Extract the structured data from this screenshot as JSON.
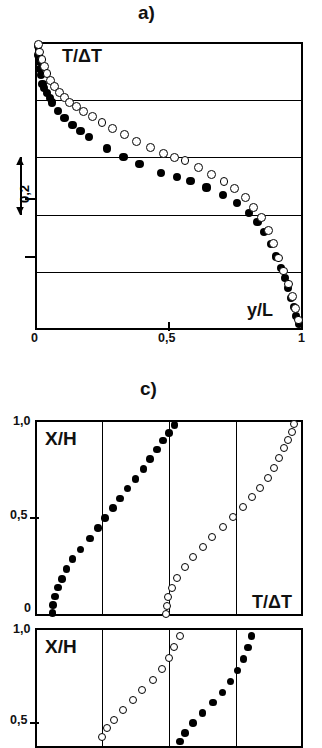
{
  "figure": {
    "panels": [
      {
        "caption": "a)",
        "y_axis_label": "T/ΔT",
        "x_axis_label": "y/L",
        "x_tick_labels": [
          "0",
          "0,5",
          "1"
        ],
        "scale_bar_label": "0,2"
      },
      {
        "caption": "c)",
        "y_axis_label": "X/H",
        "x_axis_label": "T/ΔT",
        "y_tick_labels": [
          "1,0",
          "0,5",
          "0"
        ]
      },
      {
        "caption": "",
        "y_axis_label": "X/H",
        "y_tick_labels": [
          "1,0",
          "0,5"
        ]
      }
    ],
    "series_names": [
      "filled-circles",
      "open-circles"
    ],
    "colors": {
      "ink": "#000000",
      "background": "#ffffff"
    }
  },
  "chart_data": [
    {
      "type": "scatter",
      "title": "a)",
      "xlabel": "y/L",
      "ylabel": "T/ΔT",
      "xlim": [
        0,
        1
      ],
      "ylim": [
        0,
        1
      ],
      "xticks": [
        0,
        0.5,
        1
      ],
      "xticklabels": [
        "0",
        "0,5",
        "1"
      ],
      "grid": "horizontal",
      "gridlines_y": [
        0.2,
        0.4,
        0.6,
        0.8
      ],
      "scale_bar": "0,2",
      "series": [
        {
          "name": "filled-circles",
          "marker": "filled",
          "x": [
            0.01,
            0.013,
            0.018,
            0.02,
            0.022,
            0.028,
            0.035,
            0.045,
            0.055,
            0.062,
            0.085,
            0.11,
            0.14,
            0.17,
            0.2,
            0.27,
            0.33,
            0.39,
            0.47,
            0.53,
            0.58,
            0.64,
            0.7,
            0.755,
            0.8,
            0.83,
            0.855,
            0.88,
            0.9,
            0.918,
            0.932,
            0.945,
            0.955,
            0.965,
            0.975,
            0.985
          ],
          "y": [
            0.985,
            0.955,
            0.93,
            0.905,
            0.885,
            0.855,
            0.84,
            0.822,
            0.805,
            0.79,
            0.76,
            0.735,
            0.712,
            0.69,
            0.67,
            0.63,
            0.6,
            0.575,
            0.545,
            0.53,
            0.518,
            0.495,
            0.47,
            0.44,
            0.405,
            0.375,
            0.34,
            0.3,
            0.255,
            0.215,
            0.18,
            0.145,
            0.11,
            0.08,
            0.05,
            0.02
          ]
        },
        {
          "name": "open-circles",
          "marker": "open",
          "x": [
            0.012,
            0.018,
            0.026,
            0.034,
            0.045,
            0.058,
            0.072,
            0.09,
            0.11,
            0.13,
            0.155,
            0.18,
            0.215,
            0.25,
            0.29,
            0.335,
            0.38,
            0.43,
            0.48,
            0.52,
            0.56,
            0.61,
            0.66,
            0.705,
            0.745,
            0.785,
            0.815,
            0.845,
            0.87,
            0.89,
            0.91,
            0.928,
            0.945,
            0.96,
            0.972,
            0.982
          ],
          "y": [
            0.99,
            0.965,
            0.94,
            0.915,
            0.89,
            0.865,
            0.845,
            0.825,
            0.808,
            0.79,
            0.775,
            0.76,
            0.74,
            0.72,
            0.7,
            0.678,
            0.655,
            0.635,
            0.612,
            0.6,
            0.588,
            0.565,
            0.54,
            0.515,
            0.49,
            0.46,
            0.425,
            0.39,
            0.345,
            0.3,
            0.25,
            0.205,
            0.16,
            0.115,
            0.075,
            0.035
          ]
        }
      ]
    },
    {
      "type": "scatter",
      "title": "c)",
      "xlabel": "T/ΔT",
      "ylabel": "X/H",
      "ylim": [
        0,
        1
      ],
      "yticks": [
        0,
        0.5,
        1
      ],
      "yticklabels": [
        "0",
        "0,5",
        "1,0"
      ],
      "grid": "vertical",
      "gridlines_x": [
        0.25,
        0.5,
        0.75
      ],
      "series": [
        {
          "name": "filled-circles",
          "marker": "filled",
          "x": [
            0.065,
            0.068,
            0.075,
            0.085,
            0.1,
            0.118,
            0.14,
            0.17,
            0.205,
            0.235,
            0.262,
            0.29,
            0.318,
            0.345,
            0.375,
            0.405,
            0.43,
            0.455,
            0.478,
            0.5,
            0.52
          ],
          "y": [
            0.015,
            0.055,
            0.1,
            0.145,
            0.19,
            0.24,
            0.29,
            0.34,
            0.395,
            0.45,
            0.5,
            0.55,
            0.6,
            0.65,
            0.7,
            0.75,
            0.8,
            0.85,
            0.895,
            0.935,
            0.975
          ]
        },
        {
          "name": "open-circles",
          "marker": "open",
          "x": [
            0.49,
            0.492,
            0.498,
            0.51,
            0.53,
            0.558,
            0.59,
            0.625,
            0.66,
            0.7,
            0.74,
            0.775,
            0.808,
            0.84,
            0.868,
            0.892,
            0.912,
            0.93,
            0.945,
            0.958,
            0.968
          ],
          "y": [
            0.01,
            0.05,
            0.095,
            0.145,
            0.195,
            0.25,
            0.3,
            0.35,
            0.405,
            0.455,
            0.505,
            0.555,
            0.605,
            0.655,
            0.705,
            0.755,
            0.805,
            0.855,
            0.9,
            0.94,
            0.978
          ]
        }
      ]
    },
    {
      "type": "scatter",
      "title": "",
      "ylabel": "X/H",
      "ylim": [
        0.45,
        1
      ],
      "yticks": [
        0.5,
        1
      ],
      "yticklabels": [
        "0,5",
        "1,0"
      ],
      "grid": "vertical",
      "gridlines_x": [
        0.25,
        0.5,
        0.75
      ],
      "series": [
        {
          "name": "open-circles",
          "marker": "open",
          "x": [
            0.25,
            0.268,
            0.295,
            0.33,
            0.365,
            0.4,
            0.44,
            0.475,
            0.5,
            0.52,
            0.54
          ],
          "y": [
            0.5,
            0.54,
            0.58,
            0.625,
            0.67,
            0.715,
            0.76,
            0.81,
            0.862,
            0.912,
            0.962
          ]
        },
        {
          "name": "filled-circles",
          "marker": "filled",
          "x": [
            0.54,
            0.56,
            0.59,
            0.625,
            0.665,
            0.7,
            0.73,
            0.755,
            0.778,
            0.795,
            0.808
          ],
          "y": [
            0.48,
            0.52,
            0.565,
            0.61,
            0.658,
            0.705,
            0.755,
            0.805,
            0.858,
            0.91,
            0.962
          ]
        }
      ]
    }
  ]
}
